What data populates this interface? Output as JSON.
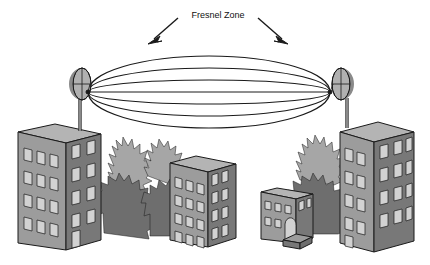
{
  "diagram": {
    "title": "Fresnel Zone",
    "label": {
      "text": "Fresnel Zone",
      "x": 218,
      "y": 15
    },
    "pointers": [
      {
        "name": "left-pointer",
        "from_x": 178,
        "from_y": 18,
        "to_x": 150,
        "to_y": 43
      },
      {
        "name": "right-pointer",
        "from_x": 258,
        "from_y": 18,
        "to_x": 286,
        "to_y": 43
      }
    ],
    "fresnel_zone": {
      "center_x": 209,
      "center_y": 92,
      "focus_left_x": 88,
      "focus_right_x": 330,
      "ellipses": [
        {
          "name": "outer-ellipse",
          "rx": 121,
          "ry": 36
        },
        {
          "name": "middle-ellipse",
          "rx": 121,
          "ry": 24
        },
        {
          "name": "inner-ellipse",
          "rx": 121,
          "ry": 12
        }
      ],
      "line_of_sight": {
        "name": "line-of-sight",
        "x1": 88,
        "y1": 92,
        "x2": 330,
        "y2": 92
      }
    },
    "antennas": [
      {
        "name": "left-dish-antenna",
        "side": "left",
        "dish_cx": 82,
        "dish_cy": 84,
        "dish_rx": 9,
        "dish_ry": 16,
        "mast_x": 80,
        "mast_top": 100,
        "mast_bottom": 130
      },
      {
        "name": "right-dish-antenna",
        "side": "right",
        "dish_cx": 344,
        "dish_cy": 84,
        "dish_rx": 9,
        "dish_ry": 16,
        "mast_x": 346,
        "mast_top": 100,
        "mast_bottom": 126
      }
    ],
    "buildings": [
      {
        "name": "left-tall-building",
        "rows": 4,
        "front_cols": 3,
        "side_cols": 2
      },
      {
        "name": "center-building",
        "rows": 4,
        "front_cols": 3,
        "side_cols": 3
      },
      {
        "name": "small-arched-building",
        "rows": 2,
        "front_cols": 3,
        "side_cols": 3,
        "has_arched_door": true,
        "has_steps": true
      },
      {
        "name": "right-tall-building",
        "rows": 4,
        "front_cols": 3,
        "side_cols": 2
      }
    ],
    "foliage": {
      "name": "tree-foliage",
      "count": 6,
      "description": "stylized dark and light gray trees behind the buildings"
    },
    "colors": {
      "background": "#ffffff",
      "outline": "#1a1a1a",
      "building_front": "#9c9c9c",
      "building_side": "#787878",
      "building_roof": "#b4b4b4",
      "window_fill": "#d2d2d2",
      "tree_dark": "#6e6e6e",
      "tree_light": "#a6a6a6",
      "dish_light": "#b0b0b0",
      "dish_dark": "#8a8a8a",
      "label_text": "#111111"
    }
  }
}
